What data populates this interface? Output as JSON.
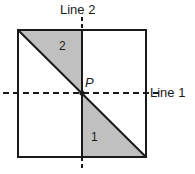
{
  "figure": {
    "labels": {
      "line1": "Line 1",
      "line2": "Line 2",
      "point": "P",
      "region_one": "1",
      "region_two": "2"
    },
    "colors": {
      "shade": "#c0c0c0",
      "stroke": "#1a1a1a",
      "background": "#ffffff"
    },
    "geometry": {
      "square": {
        "left": 18,
        "top": 30,
        "right": 146,
        "bottom": 157
      },
      "point_p": {
        "x": 82,
        "y": 93
      },
      "line1": {
        "orientation": "horizontal",
        "y": 93,
        "x_start": 3,
        "x_end": 160,
        "style": "dashed"
      },
      "line2": {
        "orientation": "vertical",
        "x": 82,
        "y_start": 17,
        "y_end": 170,
        "style": "dashed-outside-solid-inside"
      },
      "diagonal": {
        "x1": 18,
        "y1": 30,
        "x2": 146,
        "y2": 157
      },
      "shaded_region_two": "polygon(18,30 82,30 82,93)",
      "shaded_region_one": "polygon(82,93 146,157 82,157)"
    }
  }
}
